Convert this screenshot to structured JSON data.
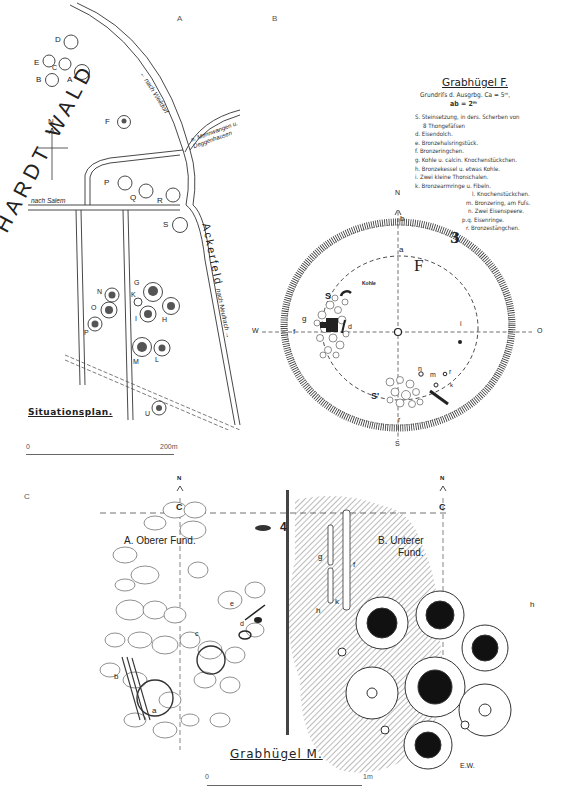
{
  "panels": {
    "a": {
      "letter": "A",
      "title": "Situationsplan.",
      "forest_label": "HARDT WALD",
      "field_label": "Ackerfeld",
      "roads": {
        "weildorf": "← nach Weildorf",
        "mennwangen": "n. Mennwangen u. Deggenhausen",
        "salem": "nach Salem",
        "neufrach": "nach Neufrach →"
      },
      "north": "N",
      "mounds": [
        "A",
        "B",
        "C",
        "D",
        "E",
        "F",
        "G",
        "H",
        "I",
        "K",
        "L",
        "M",
        "N",
        "O",
        "P",
        "Q",
        "R",
        "S",
        "T",
        "U"
      ],
      "scale": {
        "start": "0",
        "end": "200m"
      }
    },
    "b": {
      "letter": "B",
      "title": "Grabhügel F.",
      "subtitle_1": "Grundriſs d. Ausgrbg. Ca = 5ᵐ,",
      "subtitle_2": "ab = 2ᵐ",
      "legend": [
        "S. Steinsetzung, in ders. Scherben von",
        "   8 Thongefäſsen",
        "d. Eisendolch.",
        "e. Bronzehalsringstück.",
        "f. Bronzeringchen.",
        "g. Kohle u. calcin. Knochenstückchen.",
        "h. Bronzekessel u. etwas Kohle.",
        "i. Zwei kleine Thonschalen.",
        "k. Bronzearmringe u. Fibeln."
      ],
      "legend_2": [
        "l. Knochenstückchen.",
        "m. Bronzering, am Fuſs.",
        "n. Zwei Eisenspeere.",
        "p.q. Eisenringe.",
        "r. Bronzestängchen."
      ],
      "compass": {
        "n": "N",
        "s": "S",
        "w": "W",
        "o": "O"
      },
      "center": "C",
      "point_a": "a",
      "point_b": "b",
      "number": "3",
      "mound_letter": "F",
      "kohle": "Kohle",
      "find_labels": [
        "S",
        "S'",
        "d",
        "e",
        "f",
        "g",
        "h",
        "i",
        "k",
        "l",
        "m",
        "n",
        "p",
        "q",
        "r"
      ]
    },
    "c": {
      "letter": "C",
      "title": "Grabhügel M.",
      "upper_find": "A. Oberer Fund.",
      "lower_find_1": "B. Unterer",
      "lower_find_2": "Fund.",
      "north": "N",
      "center": "C",
      "number": "4",
      "labels": [
        "a",
        "b",
        "c",
        "d",
        "e",
        "f",
        "g",
        "h",
        "k"
      ],
      "signature": "E.W.",
      "scale": {
        "start": "0",
        "end": "1m"
      }
    }
  },
  "colors": {
    "ink": "#222222",
    "paper": "#ffffff",
    "hatch": "#555555"
  }
}
